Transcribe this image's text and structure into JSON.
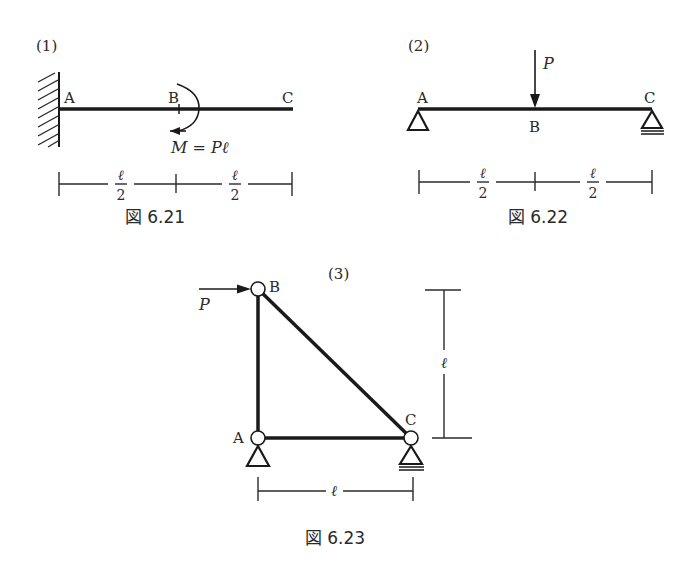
{
  "figures": [
    {
      "id": "fig-6-21",
      "problem_label": "(1)",
      "caption": "図 6.21",
      "type": "cantilever beam with applied moment",
      "nodes": {
        "A": "A",
        "B": "B",
        "C": "C"
      },
      "support_left": "fixed wall",
      "load_label": "M = Pℓ",
      "dimensions": [
        {
          "num": "ℓ",
          "den": "2"
        },
        {
          "num": "ℓ",
          "den": "2"
        }
      ]
    },
    {
      "id": "fig-6-22",
      "problem_label": "(2)",
      "caption": "図 6.22",
      "type": "simply supported beam with point load",
      "nodes": {
        "A": "A",
        "B": "B",
        "C": "C"
      },
      "support_left": "pin",
      "support_right": "roller",
      "load_label": "P",
      "dimensions": [
        {
          "num": "ℓ",
          "den": "2"
        },
        {
          "num": "ℓ",
          "den": "2"
        }
      ]
    },
    {
      "id": "fig-6-23",
      "problem_label": "(3)",
      "caption": "図 6.23",
      "type": "triangular truss with horizontal load",
      "nodes": {
        "A": "A",
        "B": "B",
        "C": "C"
      },
      "support_A": "pin",
      "support_C": "roller",
      "load_label": "P",
      "dimensions": {
        "horizontal": "ℓ",
        "vertical": "ℓ"
      }
    }
  ],
  "colors": {
    "line": "#1a1a1a",
    "text": "#2a2a2a",
    "background": "#ffffff"
  }
}
